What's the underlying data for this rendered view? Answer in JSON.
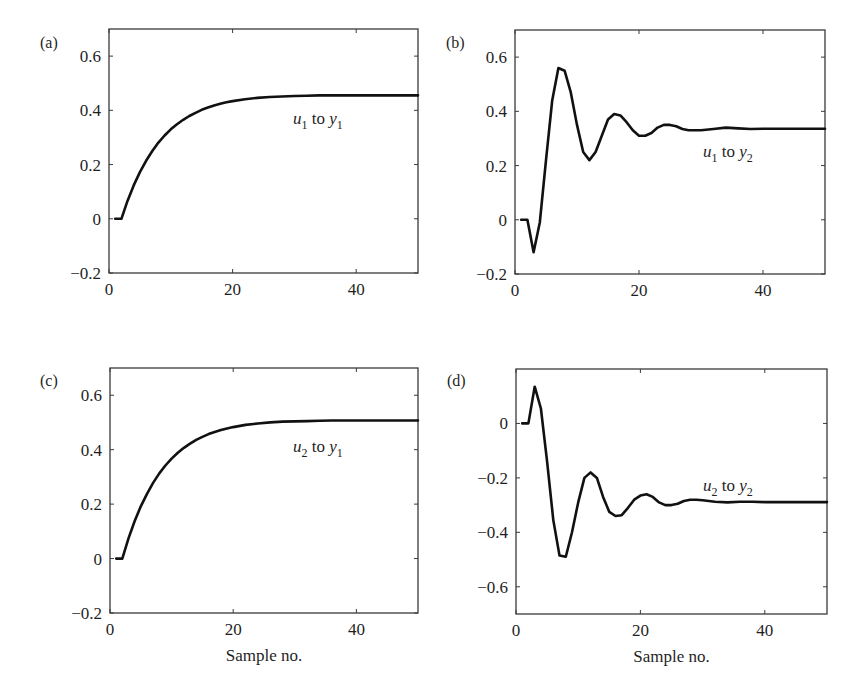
{
  "chart_data": [
    {
      "id": "a",
      "panel_label": "(a)",
      "type": "line",
      "title": "",
      "series_label": {
        "u": "u",
        "u_sub": "1",
        "to": " to ",
        "y": "y",
        "y_sub": "1"
      },
      "xlabel": "",
      "ylabel": "",
      "xlim": [
        0,
        50
      ],
      "ylim": [
        -0.2,
        0.7
      ],
      "xticks": [
        0,
        20,
        40
      ],
      "yticks": [
        -0.2,
        0,
        0.2,
        0.4,
        0.6
      ],
      "ytick_labels": [
        "−0.2",
        "0",
        "0.2",
        "0.4",
        "0.6"
      ],
      "xtick_labels": [
        "0",
        "20",
        "40"
      ],
      "grid": false,
      "x": [
        1,
        2,
        3,
        4,
        5,
        6,
        7,
        8,
        9,
        10,
        11,
        12,
        13,
        14,
        15,
        16,
        17,
        18,
        19,
        20,
        22,
        24,
        26,
        28,
        30,
        32,
        34,
        36,
        38,
        40,
        42,
        44,
        46,
        48,
        50
      ],
      "values": [
        0,
        0,
        0.066,
        0.123,
        0.172,
        0.214,
        0.25,
        0.281,
        0.307,
        0.33,
        0.349,
        0.365,
        0.379,
        0.391,
        0.402,
        0.41,
        0.418,
        0.424,
        0.43,
        0.434,
        0.441,
        0.446,
        0.449,
        0.451,
        0.453,
        0.454,
        0.455,
        0.455,
        0.455,
        0.455,
        0.455,
        0.455,
        0.455,
        0.455,
        0.455
      ]
    },
    {
      "id": "b",
      "panel_label": "(b)",
      "type": "line",
      "title": "",
      "series_label": {
        "u": "u",
        "u_sub": "1",
        "to": " to ",
        "y": "y",
        "y_sub": "2"
      },
      "xlabel": "",
      "ylabel": "",
      "xlim": [
        0,
        50
      ],
      "ylim": [
        -0.2,
        0.7
      ],
      "xticks": [
        0,
        20,
        40
      ],
      "yticks": [
        -0.2,
        0,
        0.2,
        0.4,
        0.6
      ],
      "ytick_labels": [
        "−0.2",
        "0",
        "0.2",
        "0.4",
        "0.6"
      ],
      "xtick_labels": [
        "0",
        "20",
        "40"
      ],
      "grid": false,
      "x": [
        1,
        2,
        3,
        4,
        5,
        6,
        7,
        8,
        9,
        10,
        11,
        12,
        13,
        14,
        15,
        16,
        17,
        18,
        19,
        20,
        21,
        22,
        23,
        24,
        25,
        26,
        27,
        28,
        29,
        30,
        32,
        34,
        36,
        38,
        40,
        42,
        44,
        46,
        48,
        50
      ],
      "values": [
        0,
        0,
        -0.12,
        -0.01,
        0.22,
        0.44,
        0.56,
        0.55,
        0.47,
        0.35,
        0.25,
        0.22,
        0.25,
        0.31,
        0.37,
        0.39,
        0.385,
        0.36,
        0.33,
        0.31,
        0.31,
        0.32,
        0.34,
        0.35,
        0.35,
        0.345,
        0.335,
        0.33,
        0.33,
        0.33,
        0.335,
        0.34,
        0.337,
        0.335,
        0.336,
        0.336,
        0.336,
        0.336,
        0.336,
        0.336
      ]
    },
    {
      "id": "c",
      "panel_label": "(c)",
      "type": "line",
      "title": "",
      "series_label": {
        "u": "u",
        "u_sub": "2",
        "to": " to ",
        "y": "y",
        "y_sub": "1"
      },
      "xlabel": "Sample no.",
      "ylabel": "",
      "xlim": [
        0,
        50
      ],
      "ylim": [
        -0.2,
        0.7
      ],
      "xticks": [
        0,
        20,
        40
      ],
      "yticks": [
        -0.2,
        0,
        0.2,
        0.4,
        0.6
      ],
      "ytick_labels": [
        "−0.2",
        "0",
        "0.2",
        "0.4",
        "0.6"
      ],
      "xtick_labels": [
        "0",
        "20",
        "40"
      ],
      "grid": false,
      "x": [
        1,
        2,
        3,
        4,
        5,
        6,
        7,
        8,
        9,
        10,
        11,
        12,
        13,
        14,
        15,
        16,
        17,
        18,
        19,
        20,
        22,
        24,
        26,
        28,
        30,
        32,
        34,
        36,
        38,
        40,
        42,
        44,
        46,
        48,
        50
      ],
      "values": [
        0,
        0,
        0.074,
        0.137,
        0.192,
        0.238,
        0.278,
        0.313,
        0.342,
        0.367,
        0.389,
        0.407,
        0.422,
        0.436,
        0.447,
        0.457,
        0.465,
        0.472,
        0.478,
        0.483,
        0.491,
        0.496,
        0.5,
        0.503,
        0.504,
        0.505,
        0.506,
        0.507,
        0.507,
        0.507,
        0.507,
        0.507,
        0.507,
        0.507,
        0.507
      ]
    },
    {
      "id": "d",
      "panel_label": "(d)",
      "type": "line",
      "title": "",
      "series_label": {
        "u": "u",
        "u_sub": "2",
        "to": " to ",
        "y": "y",
        "y_sub": "2"
      },
      "xlabel": "Sample no.",
      "ylabel": "",
      "xlim": [
        0,
        50
      ],
      "ylim": [
        -0.7,
        0.2
      ],
      "xticks": [
        0,
        20,
        40
      ],
      "yticks": [
        -0.6,
        -0.4,
        -0.2,
        0
      ],
      "ytick_labels": [
        "−0.6",
        "−0.4",
        "−0.2",
        "0"
      ],
      "xtick_labels": [
        "0",
        "20",
        "40"
      ],
      "grid": false,
      "x": [
        1,
        2,
        3,
        4,
        5,
        6,
        7,
        8,
        9,
        10,
        11,
        12,
        13,
        14,
        15,
        16,
        17,
        18,
        19,
        20,
        21,
        22,
        23,
        24,
        25,
        26,
        27,
        28,
        29,
        30,
        32,
        34,
        36,
        38,
        40,
        42,
        44,
        46,
        48,
        50
      ],
      "values": [
        0,
        0,
        0.135,
        0.055,
        -0.14,
        -0.355,
        -0.485,
        -0.49,
        -0.4,
        -0.29,
        -0.2,
        -0.18,
        -0.2,
        -0.27,
        -0.325,
        -0.34,
        -0.337,
        -0.31,
        -0.28,
        -0.265,
        -0.26,
        -0.27,
        -0.29,
        -0.3,
        -0.3,
        -0.295,
        -0.285,
        -0.28,
        -0.28,
        -0.282,
        -0.288,
        -0.29,
        -0.288,
        -0.288,
        -0.289,
        -0.289,
        -0.289,
        -0.289,
        -0.289,
        -0.289
      ]
    }
  ],
  "layout": {
    "panels": [
      {
        "left": 109,
        "top": 29,
        "right": 418,
        "bottom": 273,
        "label_x": 40,
        "label_y": 48,
        "series_label_x": 293,
        "series_label_y": 124
      },
      {
        "left": 515,
        "top": 30,
        "right": 825,
        "bottom": 274,
        "label_x": 446,
        "label_y": 48,
        "series_label_x": 703,
        "series_label_y": 157
      },
      {
        "left": 110,
        "top": 368,
        "right": 418,
        "bottom": 613,
        "label_x": 40,
        "label_y": 386,
        "series_label_x": 293,
        "series_label_y": 452
      },
      {
        "left": 516,
        "top": 369,
        "right": 827,
        "bottom": 614,
        "label_x": 447,
        "label_y": 386,
        "series_label_x": 703,
        "series_label_y": 491
      }
    ]
  }
}
